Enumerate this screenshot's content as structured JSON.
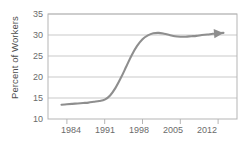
{
  "chart_data": {
    "type": "line",
    "title": "",
    "xlabel": "",
    "ylabel": "Percent of Workers",
    "xlim": [
      1980.5,
      2015.5
    ],
    "ylim": [
      10,
      35
    ],
    "grid": true,
    "legend": null,
    "annotations": [
      "arrowhead at right end of trend line indicating continuation"
    ],
    "x_ticks": [
      "1984",
      "1991",
      "1998",
      "2005",
      "2012"
    ],
    "y_ticks": [
      "10",
      "15",
      "20",
      "25",
      "30",
      "35"
    ],
    "series": [
      {
        "name": "Percent of Workers",
        "x": [
          1983,
          1984,
          1985,
          1986,
          1987,
          1988,
          1989,
          1990,
          1991,
          1992,
          1993,
          1994,
          1995,
          1996,
          1997,
          1998,
          1999,
          2000,
          2001,
          2002,
          2003,
          2004,
          2005,
          2006,
          2007,
          2008,
          2009,
          2010,
          2011,
          2012,
          2013
        ],
        "values": [
          13.4,
          13.5,
          13.6,
          13.7,
          13.8,
          13.9,
          14.1,
          14.3,
          14.6,
          15.6,
          17.4,
          19.8,
          22.5,
          25.2,
          27.4,
          29.0,
          29.9,
          30.4,
          30.5,
          30.3,
          30.0,
          29.7,
          29.6,
          29.6,
          29.7,
          29.8,
          30.0,
          30.1,
          30.3,
          30.4,
          30.5
        ]
      }
    ]
  },
  "colors": {
    "line": "#8e8e8e",
    "grid": "#c9c9c9",
    "frame": "#b5b5b5",
    "tick_text": "#6b6b6b",
    "axis_label": "#4d4d4d",
    "background": "#ffffff"
  }
}
